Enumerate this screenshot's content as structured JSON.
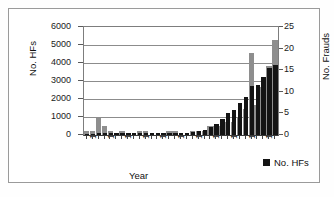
{
  "chart_data": {
    "type": "bar",
    "title": "",
    "subtitle": "",
    "xlabel": "Year",
    "ylabel": "No. HFs",
    "y2label": "No. Frauds",
    "ylim": [
      0,
      6000
    ],
    "y2lim": [
      0,
      25
    ],
    "yticks": [
      "0",
      "1000",
      "2000",
      "3000",
      "4000",
      "5000",
      "6000"
    ],
    "y2ticks": [
      "0",
      "5",
      "10",
      "15",
      "20",
      "25"
    ],
    "grid": true,
    "legend_position": "bottom-right",
    "legend": [
      "No. HFs"
    ],
    "categories": [
      "1968",
      "1969",
      "1970",
      "1971",
      "1972",
      "1973",
      "1974",
      "1975",
      "1976",
      "1977",
      "1978",
      "1979",
      "1980",
      "1981",
      "1982",
      "1983",
      "1984",
      "1985",
      "1986",
      "1987",
      "1988",
      "1989",
      "1990",
      "1991",
      "1992",
      "1993",
      "1994",
      "1995",
      "1996",
      "1997",
      "1998",
      "1999",
      "2000"
    ],
    "xtick_labels": [
      "1968",
      "1971",
      "1974",
      "1977",
      "1980",
      "1983",
      "1986",
      "1989",
      "1992",
      "1995",
      "1998"
    ],
    "series": [
      {
        "name": "No. Frauds",
        "axis": "right",
        "color": "#8e8e8e",
        "values": [
          1,
          1,
          4,
          2,
          1,
          0,
          1,
          0,
          0,
          1,
          1,
          0,
          0,
          0,
          1,
          1,
          0,
          0,
          1,
          1,
          1,
          2,
          2,
          2,
          3,
          3,
          4,
          6,
          19,
          7,
          11,
          16,
          22
        ]
      },
      {
        "name": "No. HFs",
        "axis": "left",
        "color": "#141414",
        "values": [
          80,
          80,
          90,
          90,
          90,
          90,
          90,
          90,
          90,
          100,
          100,
          100,
          100,
          100,
          110,
          110,
          110,
          120,
          150,
          230,
          300,
          420,
          620,
          900,
          1200,
          1400,
          1800,
          2100,
          2700,
          2800,
          3200,
          3700,
          3900
        ]
      }
    ]
  },
  "legend": {
    "marker": "square",
    "label": "No. HFs"
  }
}
